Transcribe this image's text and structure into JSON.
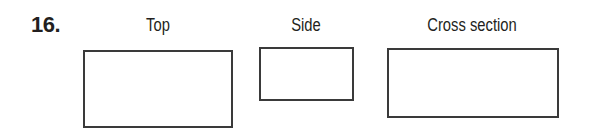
{
  "problem": {
    "number": "16.",
    "views": [
      {
        "label": "Top"
      },
      {
        "label": "Side"
      },
      {
        "label": "Cross section"
      }
    ]
  }
}
